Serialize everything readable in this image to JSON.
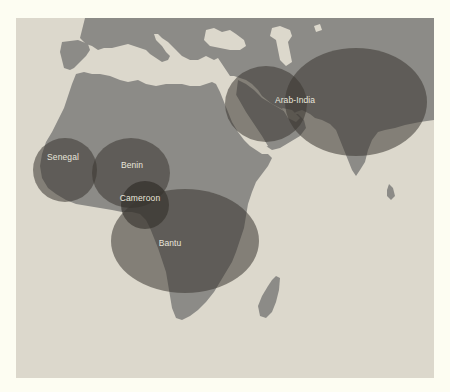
{
  "map": {
    "colors": {
      "page_background": "#fdfdf2",
      "sea": "#dcd8cc",
      "land": "#8c8b87",
      "region_fill": "#3a3632",
      "label_text": "#e9e6dc"
    },
    "regions": [
      {
        "id": "senegal",
        "label": "Senegal"
      },
      {
        "id": "benin",
        "label": "Benin"
      },
      {
        "id": "cameroon",
        "label": "Cameroon"
      },
      {
        "id": "bantu",
        "label": "Bantu"
      },
      {
        "id": "arab-india",
        "label": "Arab-India"
      }
    ]
  }
}
